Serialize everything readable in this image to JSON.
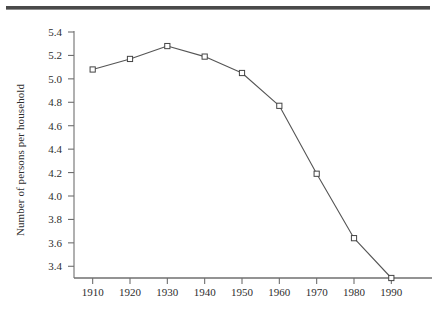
{
  "figure": {
    "top_rule_color": "#4a4a4a",
    "background": "#ffffff",
    "axis_color": "#6f6f6f",
    "line_color": "#555555",
    "marker_fill": "#ffffff",
    "marker_edge": "#444444"
  },
  "chart_data": {
    "type": "line",
    "title": "",
    "xlabel": "",
    "ylabel": "Number of persons per household",
    "x": [
      1910,
      1920,
      1930,
      1940,
      1950,
      1960,
      1970,
      1980,
      1990
    ],
    "categories": [
      "1910",
      "1920",
      "1930",
      "1940",
      "1950",
      "1960",
      "1970",
      "1980",
      "1990"
    ],
    "values": [
      5.08,
      5.17,
      5.28,
      5.19,
      5.05,
      4.77,
      4.19,
      3.64,
      3.3
    ],
    "series": [
      {
        "name": "Persons per household",
        "values": [
          5.08,
          5.17,
          5.28,
          5.19,
          5.05,
          4.77,
          4.19,
          3.64,
          3.3
        ]
      }
    ],
    "ylim": [
      3.3,
      5.4
    ],
    "xlim": [
      1905,
      1995
    ],
    "yticks": [
      3.4,
      3.6,
      3.8,
      4.0,
      4.2,
      4.4,
      4.6,
      4.8,
      5.0,
      5.2,
      5.4
    ],
    "ytick_labels": [
      "3.4",
      "3.6",
      "3.8",
      "4.0",
      "4.2",
      "4.4",
      "4.6",
      "4.8",
      "5.0",
      "5.2",
      "5.4"
    ],
    "xticks": [
      1910,
      1920,
      1930,
      1940,
      1950,
      1960,
      1970,
      1980,
      1990
    ],
    "xtick_labels": [
      "1910",
      "1920",
      "1930",
      "1940",
      "1950",
      "1960",
      "1970",
      "1980",
      "1990"
    ],
    "grid": false,
    "legend": null,
    "marker": "open-square",
    "annotations": []
  }
}
